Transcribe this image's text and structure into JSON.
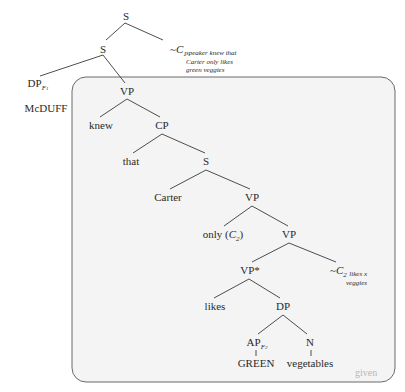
{
  "diagram": {
    "type": "syntax-tree",
    "nodes": {
      "root_s": {
        "label": "S"
      },
      "s": {
        "label": "S"
      },
      "c1": {
        "prefix": "~",
        "label": "C",
        "sub": "1",
        "note_lines": [
          "speaker knew that",
          "Carter only likes",
          "green veggies"
        ]
      },
      "dp_f1": {
        "label": "DP",
        "sub": "F",
        "subsub": "1"
      },
      "mcduff": {
        "label": "McDUFF"
      },
      "vp1": {
        "label": "VP"
      },
      "knew": {
        "label": "knew"
      },
      "cp": {
        "label": "CP"
      },
      "that": {
        "label": "that"
      },
      "s2": {
        "label": "S"
      },
      "carter": {
        "label": "Carter"
      },
      "vp2": {
        "label": "VP"
      },
      "only": {
        "label": "only (",
        "c": "C",
        "sub": "2",
        "close": ")"
      },
      "vp3": {
        "label": "VP"
      },
      "vpstar": {
        "label": "VP*"
      },
      "c2": {
        "prefix": "~",
        "label": "C",
        "sub": "2",
        "note_lines": [
          "likes x",
          "veggies"
        ]
      },
      "likes": {
        "label": "likes"
      },
      "dp": {
        "label": "DP"
      },
      "ap_f2": {
        "label": "AP",
        "sub": "F",
        "subsub": "2"
      },
      "n": {
        "label": "N"
      },
      "green": {
        "label": "GREEN"
      },
      "vegetables": {
        "label": "vegetables"
      }
    },
    "box_label": "given",
    "colors": {
      "line": "#3a3a3a",
      "box_fill": "#f4f4f4",
      "box_border": "#6a6a6a",
      "given_text": "#b8b8b8"
    }
  }
}
